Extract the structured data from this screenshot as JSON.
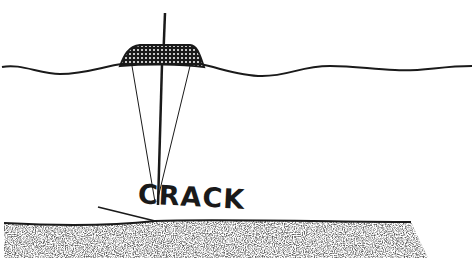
{
  "diagram": {
    "label": "CRACK",
    "colors": {
      "ink": "#1a1a1a",
      "background": "#ffffff"
    },
    "elements": {
      "water_surface": "wavy sea surface line",
      "vessel": "stippled survey vessel on surface",
      "mast": "vertical line rising above and descending from vessel",
      "beam_left": "thin ray from vessel to seabed crack",
      "beam_right": "thin ray from vessel to seabed crack",
      "seabed": "stippled sediment layer with surface line",
      "crack_line": "slanted line along seabed surface at crack"
    }
  }
}
